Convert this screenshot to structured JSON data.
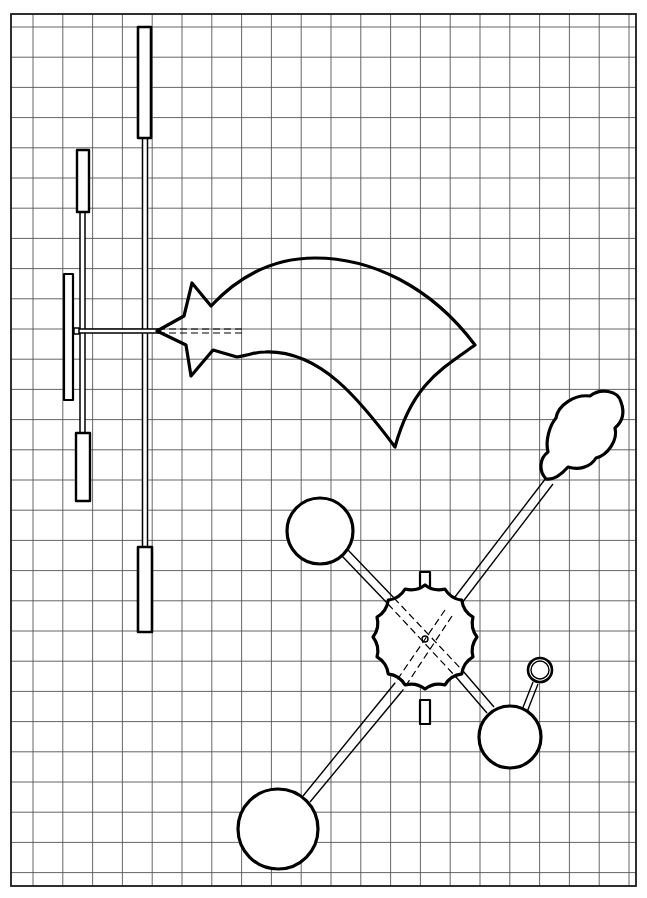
{
  "diagram": {
    "type": "mobile-construction-plan",
    "background": "#ffffff",
    "line_color": "#000000",
    "grid": {
      "left": 11,
      "top": 14,
      "right": 636,
      "bottom": 886,
      "spacing_x": 29.8,
      "spacing_y": 30.2,
      "first_x": 33,
      "first_y": 27,
      "grid_color": "#555555"
    },
    "left_mobile": {
      "description": "vertical hanging mobile of bars with a shooting star",
      "main_rod": {
        "x": 145,
        "top": 138,
        "bottom": 548
      },
      "main_top_bar": {
        "x": 138,
        "y": 27,
        "w": 13,
        "h": 111
      },
      "main_bottom_bar": {
        "x": 138,
        "y": 547,
        "w": 14,
        "h": 85
      },
      "left_rod": {
        "x": 82,
        "top": 212,
        "bottom": 433
      },
      "left_top_bar": {
        "x": 77,
        "y": 150,
        "w": 12,
        "h": 62
      },
      "left_bottom_bar": {
        "x": 76,
        "y": 433,
        "w": 14,
        "h": 68
      },
      "far_left_bar": {
        "x": 64,
        "y": 274,
        "w": 10,
        "h": 126
      },
      "cross_rod": {
        "x1": 74,
        "x2": 157,
        "y": 331
      },
      "dashed_extension": {
        "x1": 157,
        "x2": 242,
        "y": 331
      }
    },
    "shooting_star": {
      "description": "five-point star with curved comet tail"
    },
    "right_mobile": {
      "description": "scalloped sun hub with four arms ending in circles and a cloud",
      "hub_center": [
        425,
        637
      ],
      "hub_radius": 52,
      "hub_tabs": [
        {
          "x": 420,
          "y": 572,
          "w": 10,
          "h": 22
        },
        {
          "x": 420,
          "y": 700,
          "w": 10,
          "h": 24
        }
      ],
      "circles": [
        {
          "name": "upper-left-circle",
          "cx": 320,
          "cy": 531,
          "r": 34
        },
        {
          "name": "lower-left-circle",
          "cx": 278,
          "cy": 829,
          "r": 40
        },
        {
          "name": "lower-right-circle",
          "cx": 510,
          "cy": 737,
          "r": 31
        },
        {
          "name": "small-ring",
          "cx": 539,
          "cy": 671,
          "r": 12
        }
      ],
      "cloud_center": [
        582,
        426
      ]
    }
  }
}
